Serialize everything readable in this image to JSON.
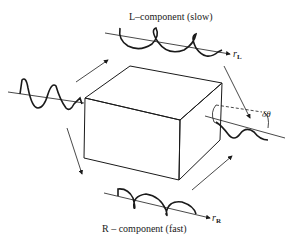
{
  "diagram": {
    "labels": {
      "top": "L–component (slow)",
      "bottom": "R – component (fast)",
      "axis_left_r": "r",
      "axis_left_sub": "L",
      "axis_right_r": "r",
      "axis_right_sub": "R",
      "rotation": "δθ"
    },
    "components": [
      {
        "name": "input-wave",
        "type": "linear-polarized"
      },
      {
        "name": "L-component",
        "type": "helix",
        "speed": "slow"
      },
      {
        "name": "R-component",
        "type": "helix",
        "speed": "fast"
      },
      {
        "name": "output-wave",
        "type": "rotated-linear"
      },
      {
        "name": "medium",
        "type": "box"
      }
    ],
    "colors": {
      "ink": "#1a1a1a",
      "background": "#ffffff"
    }
  }
}
